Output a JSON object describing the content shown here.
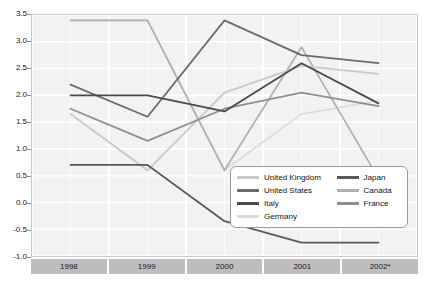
{
  "chart_data": {
    "type": "line",
    "title": "",
    "xlabel": "",
    "ylabel": "",
    "categories": [
      "1998",
      "1999",
      "2000",
      "2001",
      "2002*"
    ],
    "ylim": [
      -1.0,
      3.5
    ],
    "yticks": [
      "3.5",
      "3.0",
      "2.5",
      "2.0",
      "1.5",
      "1.0",
      "0.5",
      "0.0",
      "-0.5",
      "-1.0"
    ],
    "ytick_values": [
      3.5,
      3.0,
      2.5,
      2.0,
      1.5,
      1.0,
      0.5,
      0.0,
      -0.5,
      -1.0
    ],
    "grid": true,
    "legend_position": "inside-bottom-right",
    "series": [
      {
        "name": "United Kingdom",
        "color": "#c9c9c9",
        "values": [
          1.65,
          0.6,
          2.05,
          2.55,
          2.4
        ]
      },
      {
        "name": "United States",
        "color": "#6b6b6b",
        "values": [
          2.2,
          1.6,
          3.4,
          2.75,
          2.6
        ]
      },
      {
        "name": "Italy",
        "color": "#4a4a4a",
        "values": [
          2.0,
          2.0,
          1.7,
          2.6,
          1.85
        ]
      },
      {
        "name": "Germany",
        "color": "#dcdcdc",
        "values": [
          3.4,
          3.4,
          0.6,
          1.65,
          1.9
        ]
      },
      {
        "name": "Japan",
        "color": "#5a5a5a",
        "values": [
          0.7,
          0.7,
          -0.35,
          -0.75,
          -0.75
        ]
      },
      {
        "name": "Canada",
        "color": "#b0b0b0",
        "values": [
          3.4,
          3.4,
          0.6,
          2.9,
          0.45
        ]
      },
      {
        "name": "France",
        "color": "#8f8f8f",
        "values": [
          1.75,
          1.15,
          1.75,
          2.05,
          1.8
        ]
      }
    ]
  },
  "footnote": {
    "text": ""
  }
}
